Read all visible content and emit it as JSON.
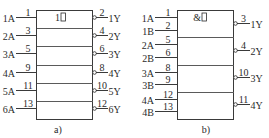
{
  "diagrams": [
    {
      "id": "a",
      "caption": "a)",
      "gate_symbol": "1",
      "symbol_suffix_icon": "blank-box-icon",
      "gates": [
        {
          "inputs": [
            {
              "name": "1A",
              "pin": "1"
            }
          ],
          "output": {
            "name": "1Y",
            "pin": "2"
          }
        },
        {
          "inputs": [
            {
              "name": "2A",
              "pin": "3"
            }
          ],
          "output": {
            "name": "2Y",
            "pin": "4"
          }
        },
        {
          "inputs": [
            {
              "name": "3A",
              "pin": "5"
            }
          ],
          "output": {
            "name": "3Y",
            "pin": "6"
          }
        },
        {
          "inputs": [
            {
              "name": "4A",
              "pin": "9"
            }
          ],
          "output": {
            "name": "4Y",
            "pin": "8"
          }
        },
        {
          "inputs": [
            {
              "name": "5A",
              "pin": "11"
            }
          ],
          "output": {
            "name": "5Y",
            "pin": "10"
          }
        },
        {
          "inputs": [
            {
              "name": "6A",
              "pin": "13"
            }
          ],
          "output": {
            "name": "6Y",
            "pin": "12"
          }
        }
      ]
    },
    {
      "id": "b",
      "caption": "b)",
      "gate_symbol": "&",
      "symbol_suffix_icon": "blank-box-icon",
      "gates": [
        {
          "inputs": [
            {
              "name": "1A",
              "pin": "1"
            },
            {
              "name": "1B",
              "pin": "2"
            }
          ],
          "output": {
            "name": "1Y",
            "pin": "3"
          }
        },
        {
          "inputs": [
            {
              "name": "2A",
              "pin": "5"
            },
            {
              "name": "2B",
              "pin": "6"
            }
          ],
          "output": {
            "name": "2Y",
            "pin": "4"
          }
        },
        {
          "inputs": [
            {
              "name": "3A",
              "pin": "8"
            },
            {
              "name": "3B",
              "pin": "9"
            }
          ],
          "output": {
            "name": "3Y",
            "pin": "10"
          }
        },
        {
          "inputs": [
            {
              "name": "4A",
              "pin": "12"
            },
            {
              "name": "4B",
              "pin": "13"
            }
          ],
          "output": {
            "name": "4Y",
            "pin": "11"
          }
        }
      ]
    }
  ]
}
